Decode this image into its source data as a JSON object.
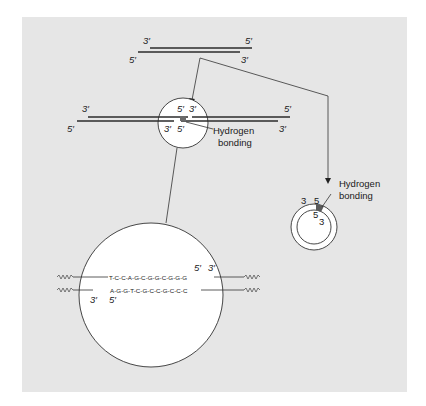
{
  "figure": {
    "background_color": "#e6e6e6",
    "hbond_color": "#6a6a6a"
  },
  "top_duplex": {
    "top_left": "3′",
    "top_right": "5′",
    "bottom_left": "5′",
    "bottom_right": "3′"
  },
  "joined_duplex": {
    "outer_top_left": "3′",
    "outer_top_right": "5′",
    "outer_bottom_left": "5′",
    "outer_bottom_right": "3′",
    "junction_top_left": "5′",
    "junction_top_right": "3′",
    "junction_bottom_left": "3′",
    "junction_bottom_right": "5′",
    "callout_line1": "Hydrogen",
    "callout_line2": "bonding"
  },
  "circular": {
    "outer_left": "3",
    "outer_right": "5",
    "inner_top": "5",
    "inner_right": "3",
    "callout_line1": "Hydrogen",
    "callout_line2": "bonding"
  },
  "magnified": {
    "top_sequence": "T-C-C-A-G-C-G-G-C-G-G-G",
    "bottom_sequence": "A-G-G-T-C-G-C-C-G-C-C-C",
    "top_end_5": "5′",
    "top_end_3": "3′",
    "bottom_end_3": "3′",
    "bottom_end_5": "5′"
  }
}
